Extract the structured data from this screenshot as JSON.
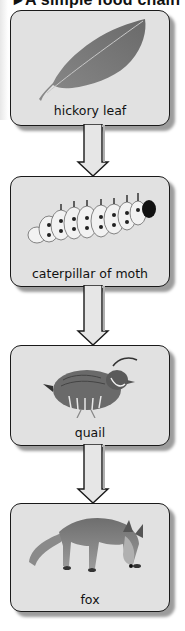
{
  "title": {
    "text": "A simple food chain",
    "marker": "▸"
  },
  "chain": [
    {
      "label": "hickory leaf",
      "image": "leaf-image"
    },
    {
      "label": "caterpillar of moth",
      "image": "caterpillar-image"
    },
    {
      "label": "quail",
      "image": "quail-image"
    },
    {
      "label": "fox",
      "image": "fox-image"
    }
  ],
  "arrows": [
    {
      "from": "hickory leaf",
      "to": "caterpillar of moth"
    },
    {
      "from": "caterpillar of moth",
      "to": "quail"
    },
    {
      "from": "quail",
      "to": "fox"
    }
  ],
  "colors": {
    "box_fill": "#e1e1e1",
    "box_border": "#1a1a1a",
    "shadow": "#9c9c9c",
    "arrow_fill": "#e6e6e6"
  }
}
